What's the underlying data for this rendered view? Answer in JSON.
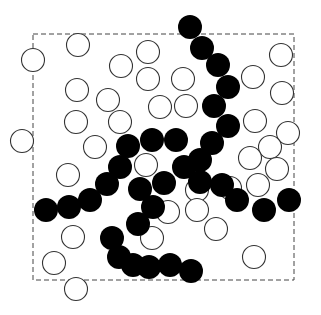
{
  "diagram": {
    "colors": {
      "background": "#ffffff",
      "open_stroke": "#333333",
      "filled": "#000000",
      "box_stroke": "#444444"
    },
    "box": {
      "x": 33,
      "y": 34,
      "width": 261,
      "height": 246
    },
    "radius": 11.5,
    "open_particles": [
      [
        78,
        45
      ],
      [
        33,
        60
      ],
      [
        121,
        66
      ],
      [
        148,
        52
      ],
      [
        148,
        79
      ],
      [
        281,
        55
      ],
      [
        253,
        77
      ],
      [
        183,
        79
      ],
      [
        77,
        90
      ],
      [
        108,
        100
      ],
      [
        160,
        107
      ],
      [
        186,
        106
      ],
      [
        282,
        93
      ],
      [
        255,
        121
      ],
      [
        76,
        122
      ],
      [
        120,
        122
      ],
      [
        22,
        141
      ],
      [
        288,
        133
      ],
      [
        95,
        147
      ],
      [
        146,
        165
      ],
      [
        270,
        147
      ],
      [
        250,
        158
      ],
      [
        68,
        175
      ],
      [
        277,
        169
      ],
      [
        258,
        185
      ],
      [
        230,
        188
      ],
      [
        197,
        190
      ],
      [
        197,
        210
      ],
      [
        168,
        212
      ],
      [
        216,
        229
      ],
      [
        152,
        238
      ],
      [
        73,
        237
      ],
      [
        54,
        263
      ],
      [
        254,
        257
      ],
      [
        76,
        289
      ]
    ],
    "filled_particles": [
      [
        190,
        27
      ],
      [
        202,
        48
      ],
      [
        218,
        65
      ],
      [
        228,
        87
      ],
      [
        214,
        106
      ],
      [
        228,
        126
      ],
      [
        212,
        143
      ],
      [
        200,
        160
      ],
      [
        176,
        140
      ],
      [
        152,
        140
      ],
      [
        128,
        146
      ],
      [
        120,
        167
      ],
      [
        107,
        184
      ],
      [
        90,
        200
      ],
      [
        69,
        207
      ],
      [
        46,
        210
      ],
      [
        184,
        167
      ],
      [
        164,
        183
      ],
      [
        140,
        189
      ],
      [
        200,
        182
      ],
      [
        222,
        185
      ],
      [
        237,
        200
      ],
      [
        264,
        210
      ],
      [
        289,
        200
      ],
      [
        153,
        207
      ],
      [
        138,
        224
      ],
      [
        112,
        238
      ],
      [
        119,
        257
      ],
      [
        133,
        265
      ],
      [
        149,
        267
      ],
      [
        170,
        265
      ],
      [
        191,
        271
      ]
    ]
  }
}
